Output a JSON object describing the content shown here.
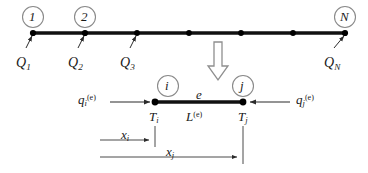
{
  "figure": {
    "colors": {
      "line": "#111111",
      "node": "#000000",
      "circle_stroke": "#8a8a8a",
      "thin_line": "#4a4a4a",
      "block_arrow_stroke": "#8a8a8a",
      "background": "#ffffff"
    }
  },
  "global_mesh": {
    "node_circles": [
      {
        "label": "1",
        "cx": 33,
        "cy": 17
      },
      {
        "label": "2",
        "cx": 85,
        "cy": 17
      },
      {
        "label": "N",
        "cx": 345,
        "cy": 17
      }
    ],
    "node_dots_x": [
      33,
      85,
      137,
      189,
      241,
      293,
      345
    ],
    "bar_y": 33,
    "flux_labels": [
      {
        "base": "Q",
        "sub": "1",
        "x": 22,
        "y": 56
      },
      {
        "base": "Q",
        "sub": "2",
        "x": 74,
        "y": 56
      },
      {
        "base": "Q",
        "sub": "3",
        "x": 126,
        "y": 56
      },
      {
        "base": "Q",
        "sub": "N",
        "x": 330,
        "y": 56
      }
    ]
  },
  "block_arrow": {
    "label": "expand-to-element",
    "x": 212,
    "y": 42
  },
  "element": {
    "element_label": "e",
    "length_label": {
      "base": "L",
      "sup": "(e)"
    },
    "node_i": {
      "circle_label": "i",
      "temperature": {
        "base": "T",
        "sub": "i"
      },
      "cx": 155
    },
    "node_j": {
      "circle_label": "j",
      "temperature": {
        "base": "T",
        "sub": "j"
      },
      "cx": 243
    },
    "bar_y": 102,
    "flux_i": {
      "base": "q",
      "sub": "i",
      "sup": "(e)"
    },
    "flux_j": {
      "base": "q",
      "sub": "j",
      "sup": "(e)"
    }
  },
  "dimensions": [
    {
      "label": {
        "base": "x",
        "sub": "i"
      },
      "x_start": 100,
      "x_end": 154,
      "y": 140
    },
    {
      "label": {
        "base": "x",
        "sub": "j"
      },
      "x_start": 100,
      "x_end": 242,
      "y": 157
    }
  ]
}
